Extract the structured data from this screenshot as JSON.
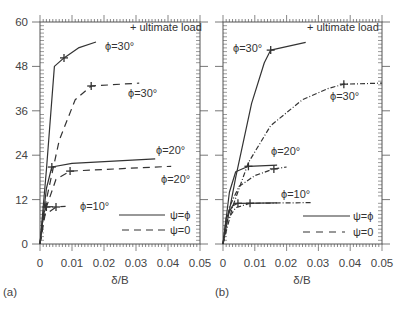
{
  "chart_data": [
    {
      "panel": "(a)",
      "type": "line",
      "xlabel": "δ/B",
      "ylabel": "",
      "xlim": [
        0,
        0.05
      ],
      "ylim": [
        0,
        60
      ],
      "xticks": [
        "0",
        "0.01",
        "0.02",
        "0.03",
        "0.04",
        "0.05"
      ],
      "yticks": [
        "0",
        "12",
        "24",
        "36",
        "48",
        "60"
      ],
      "grid": false,
      "legend": [
        {
          "label": "ψ=ϕ",
          "style": "solid"
        },
        {
          "label": "ψ=0",
          "style": "dashed"
        }
      ],
      "marker_legend": "+ ultimate load",
      "series": [
        {
          "name": "ϕ=30°, ψ=ϕ",
          "style": "solid",
          "x": [
            0,
            0.002,
            0.0045,
            0.0075,
            0.012,
            0.0175
          ],
          "y": [
            0,
            20,
            48,
            50.3,
            53,
            54.6
          ],
          "ultimate": [
            0.0075,
            50.3
          ]
        },
        {
          "name": "ϕ=30°, ψ=0",
          "style": "dashed",
          "x": [
            0,
            0.002,
            0.006,
            0.011,
            0.016,
            0.031
          ],
          "y": [
            0,
            12,
            28,
            39,
            42.7,
            43.5
          ],
          "ultimate": [
            0.016,
            42.7
          ]
        },
        {
          "name": "ϕ=20°, ψ=ϕ",
          "style": "solid",
          "x": [
            0,
            0.002,
            0.0037,
            0.01,
            0.036
          ],
          "y": [
            0,
            15,
            20.8,
            21.8,
            23
          ],
          "ultimate": [
            0.0037,
            20.8
          ]
        },
        {
          "name": "ϕ=20°, ψ=0",
          "style": "dashed",
          "x": [
            0,
            0.002,
            0.005,
            0.0094,
            0.041
          ],
          "y": [
            0,
            10,
            17.5,
            19.7,
            21
          ],
          "ultimate": [
            0.0094,
            19.7
          ]
        },
        {
          "name": "ϕ=10°, ψ=ϕ",
          "style": "solid",
          "x": [
            0,
            0.001,
            0.002,
            0.004
          ],
          "y": [
            0,
            8,
            10,
            10.1
          ],
          "ultimate": [
            0.002,
            10
          ]
        },
        {
          "name": "ϕ=10°, ψ=0",
          "style": "dashed",
          "x": [
            0,
            0.001,
            0.005,
            0.008
          ],
          "y": [
            0,
            7.5,
            10,
            10.2
          ],
          "ultimate": [
            0.005,
            10
          ]
        }
      ],
      "annotations": [
        "ϕ=30°",
        "ϕ=30°",
        "ϕ=20°",
        "ϕ=20°",
        "ϕ=10°"
      ]
    },
    {
      "panel": "(b)",
      "type": "line",
      "xlabel": "δ/B",
      "ylabel": "",
      "xlim": [
        0,
        0.05
      ],
      "ylim": [
        0,
        60
      ],
      "xticks": [
        "0",
        "0.01",
        "0.02",
        "0.03",
        "0.04",
        "0.05"
      ],
      "grid": false,
      "legend": [
        {
          "label": "ψ=ϕ",
          "style": "solid"
        },
        {
          "label": "ψ=0",
          "style": "dashed"
        }
      ],
      "marker_legend": "+ ultimate load",
      "series": [
        {
          "name": "ϕ=30°, ψ=ϕ",
          "style": "solid",
          "x": [
            0,
            0.004,
            0.009,
            0.013,
            0.015,
            0.026
          ],
          "y": [
            0,
            18,
            38,
            49,
            52.4,
            54.5
          ],
          "ultimate": [
            0.015,
            52.4
          ]
        },
        {
          "name": "ϕ=30°, ψ=0",
          "style": "dash-dot",
          "x": [
            0,
            0.003,
            0.008,
            0.015,
            0.025,
            0.033,
            0.038,
            0.05
          ],
          "y": [
            0,
            10,
            22,
            32,
            39,
            42,
            43.2,
            43.5
          ],
          "ultimate": [
            0.038,
            43.2
          ]
        },
        {
          "name": "ϕ=20°, ψ=ϕ",
          "style": "solid",
          "x": [
            0,
            0.002,
            0.004,
            0.008,
            0.017
          ],
          "y": [
            0,
            14,
            19.5,
            21,
            21.3
          ],
          "ultimate": [
            0.008,
            21
          ]
        },
        {
          "name": "ϕ=20°, ψ=0",
          "style": "dash-dot",
          "x": [
            0,
            0.002,
            0.005,
            0.01,
            0.016,
            0.02
          ],
          "y": [
            0,
            10,
            15.5,
            18.5,
            20.3,
            20.8
          ],
          "ultimate": [
            0.016,
            20.3
          ]
        },
        {
          "name": "ϕ=10°, ψ=ϕ",
          "style": "solid",
          "x": [
            0,
            0.001,
            0.003,
            0.0047,
            0.017
          ],
          "y": [
            0,
            7,
            10.3,
            11,
            11.1
          ],
          "ultimate": [
            0.0047,
            11
          ]
        },
        {
          "name": "ϕ=10°, ψ=0",
          "style": "dash-dot",
          "x": [
            0,
            0.001,
            0.004,
            0.0085,
            0.028
          ],
          "y": [
            0,
            6,
            9.8,
            11,
            11.2
          ],
          "ultimate": [
            0.0085,
            11
          ]
        }
      ],
      "annotations": [
        "ϕ=30°",
        "ϕ=30°",
        "ϕ=20°",
        "ϕ=10°"
      ]
    }
  ],
  "labels": {
    "panel_a": "(a)",
    "panel_b": "(b)",
    "xlabel": "δ/B",
    "ultimate": "+ ultimate load",
    "legend_solid": "ψ=ϕ",
    "legend_dashed": "ψ=0",
    "a_phi30_solid": "ϕ=30°",
    "a_phi30_dashed": "ϕ=30°",
    "a_phi20_solid": "ϕ=20°",
    "a_phi20_dashed": "ϕ=20°",
    "a_phi10": "ϕ=10°",
    "b_phi30_solid": "ϕ=30°",
    "b_phi30_dashed": "ϕ=30°",
    "b_phi20": "ϕ=20°",
    "b_phi10": "ϕ=10°"
  },
  "yticks": [
    "0",
    "12",
    "24",
    "36",
    "48",
    "60"
  ],
  "xticks": [
    "0",
    "0.01",
    "0.02",
    "0.03",
    "0.04",
    "0.05"
  ],
  "colors": {
    "line": "#333333",
    "axis": "#555555",
    "text": "#333333"
  }
}
